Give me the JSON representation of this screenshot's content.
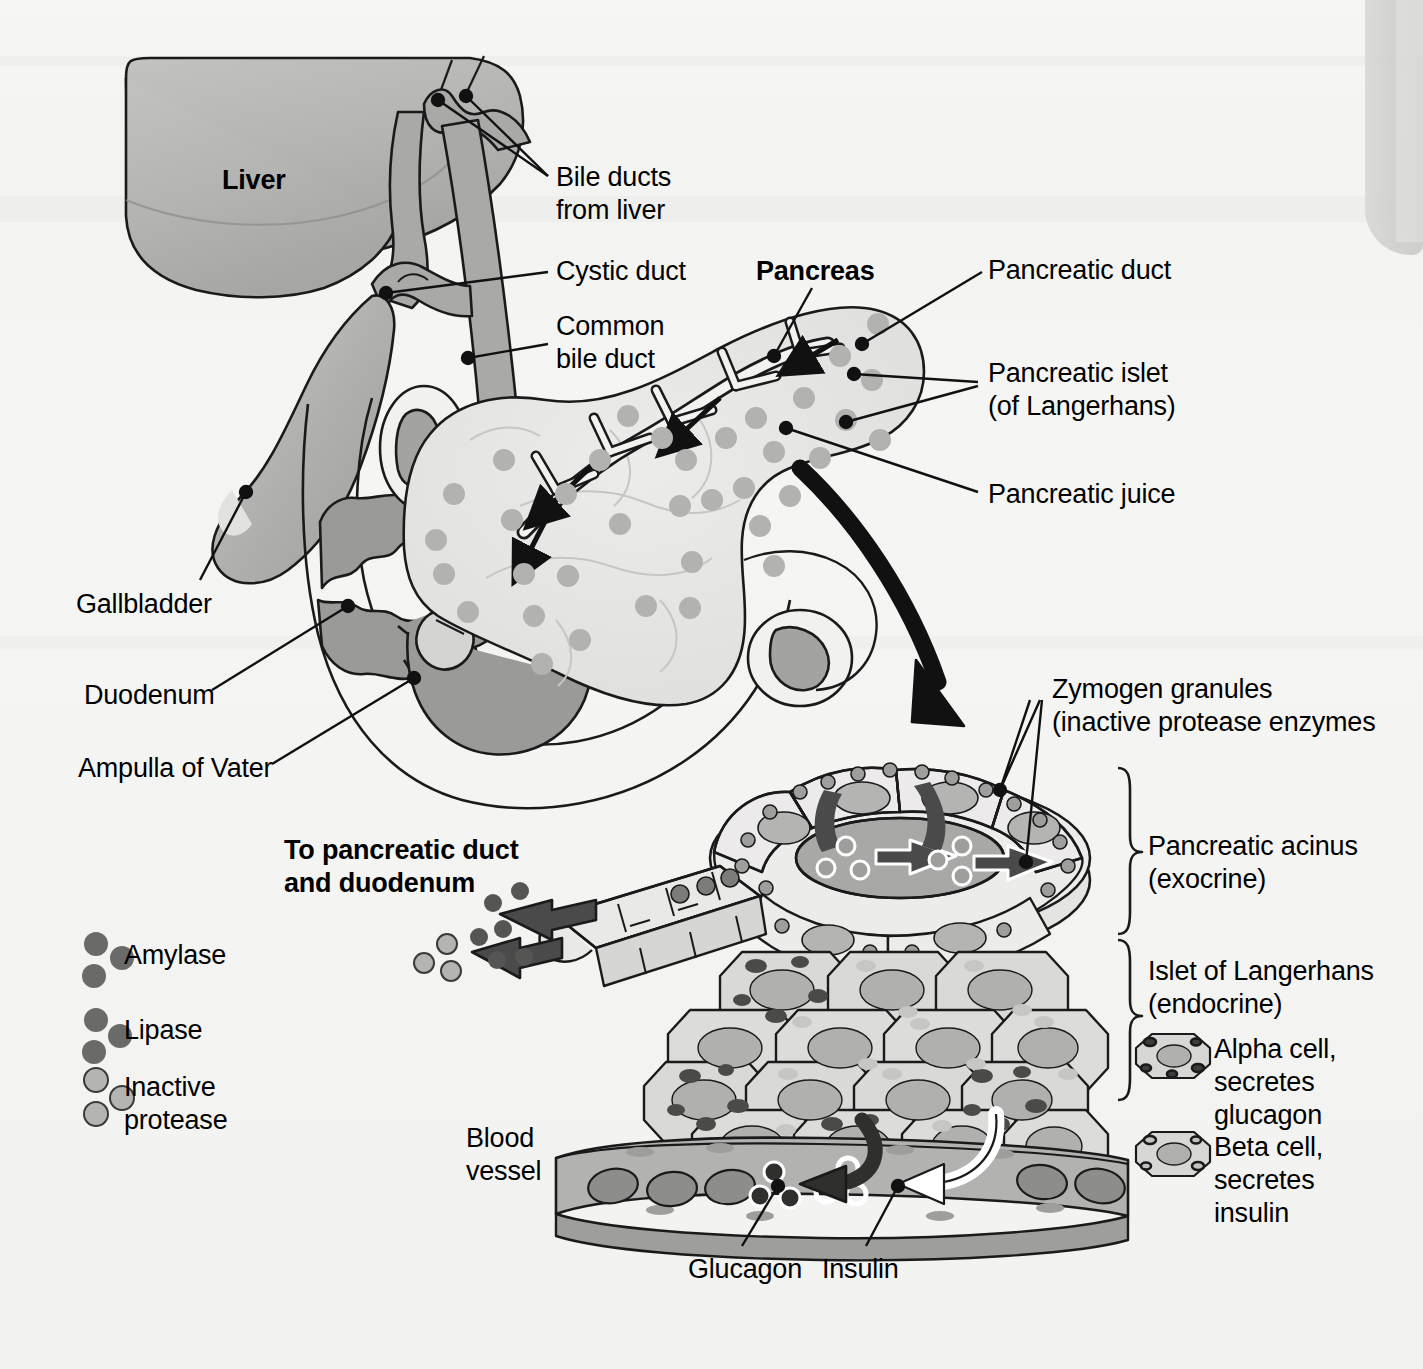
{
  "figure": {
    "type": "anatomical-diagram"
  },
  "colors": {
    "background": "#f4f4f2",
    "organ_light": "#e6e6e4",
    "organ_mid": "#b9b9b7",
    "organ_dark": "#9a9a98",
    "duct_grey": "#a9a9a7",
    "stroke": "#1a1a1a",
    "granule_dark": "#8f8f8d",
    "granule_light": "#c4c4c2",
    "vessel": "#b0b0ae",
    "arrow_dark": "#3a3a3a"
  },
  "labels": {
    "liver": "Liver",
    "bile_ducts_from_liver": "Bile ducts\nfrom liver",
    "cystic_duct": "Cystic duct",
    "common_bile_duct": "Common\nbile duct",
    "pancreas": "Pancreas",
    "pancreatic_duct": "Pancreatic duct",
    "pancreatic_islet": "Pancreatic islet\n(of Langerhans)",
    "pancreatic_juice": "Pancreatic juice",
    "gallbladder": "Gallbladder",
    "duodenum": "Duodenum",
    "ampulla_of_vater": "Ampulla of Vater",
    "zymogen_granules": "Zymogen granules\n(inactive protease enzymes",
    "pancreatic_acinus": "Pancreatic acinus\n(exocrine)",
    "islet_of_langerhans": "Islet of Langerhans\n(endocrine)",
    "alpha_cell": "Alpha cell,\nsecretes\nglucagon",
    "beta_cell": "Beta cell,\nsecretes\ninsulin",
    "to_pancreatic_duct": "To pancreatic duct\nand duodenum",
    "blood_vessel": "Blood\nvessel",
    "glucagon": "Glucagon",
    "insulin": "Insulin"
  },
  "legend": {
    "items": [
      {
        "key": "amylase",
        "label": "Amylase",
        "fill": "dark"
      },
      {
        "key": "lipase",
        "label": "Lipase",
        "fill": "dark"
      },
      {
        "key": "inactive_protease",
        "label": "Inactive\nprotease",
        "fill": "light"
      }
    ]
  }
}
